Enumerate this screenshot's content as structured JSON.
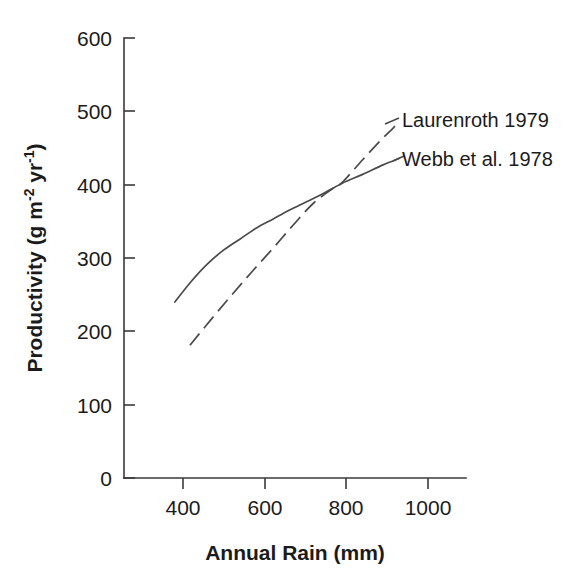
{
  "chart_data": {
    "type": "line",
    "title": "",
    "xlabel": "Annual Rain (mm)",
    "ylabel_plain": "Productivity (g m-2 yr-1)",
    "ylabel_parts": {
      "a": "Productivity (g m",
      "sup1": "-2",
      "b": " yr",
      "sup2": "-1",
      "c": ")"
    },
    "xlim": [
      250,
      1070
    ],
    "ylim": [
      0,
      600
    ],
    "xticks": [
      400,
      600,
      800,
      1000
    ],
    "xtick_labels": [
      "400",
      "600",
      "800",
      "1000"
    ],
    "yticks": [
      0,
      100,
      200,
      300,
      400,
      500,
      600
    ],
    "ytick_labels": [
      "0",
      "100",
      "200",
      "300",
      "400",
      "500",
      "600"
    ],
    "grid": false,
    "legend_position": "inline-right-of-curves",
    "colors": {
      "line": "#4a4a4a",
      "axis": "#3a3a3a",
      "text": "#1b1b1b",
      "background": "#ffffff"
    },
    "series": [
      {
        "name": "Laurenroth 1979",
        "style": "dashed",
        "x": [
          417,
          470,
          520,
          570,
          620,
          670,
          720,
          770,
          790,
          840,
          885,
          920
        ],
        "y": [
          181,
          217,
          250,
          282,
          313,
          345,
          375,
          396,
          403,
          434,
          461,
          480
        ]
      },
      {
        "name": "Webb et al. 1978",
        "style": "solid",
        "x": [
          380,
          420,
          460,
          500,
          540,
          580,
          620,
          660,
          700,
          740,
          790,
          840,
          890,
          930
        ],
        "y": [
          240,
          268,
          292,
          311,
          326,
          341,
          353,
          365,
          376,
          387,
          402,
          414,
          427,
          436
        ]
      }
    ],
    "annotations": [
      {
        "text": "Laurenroth 1979",
        "at_x": 1010,
        "at_y": 468
      },
      {
        "text": "Webb et al. 1978",
        "at_x": 1010,
        "at_y": 418
      }
    ]
  }
}
